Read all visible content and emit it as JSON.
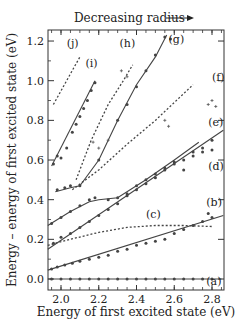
{
  "chart_data": {
    "type": "scatter",
    "title": "Decreasing radius",
    "top_annotation": "Decreasing radius",
    "xlabel": "Energy of first excited state (eV)",
    "ylabel": "Energy – energy of first excited state (eV)",
    "xlim": [
      1.93,
      2.86
    ],
    "ylim": [
      -0.055,
      1.25
    ],
    "xticks": [
      2.0,
      2.2,
      2.4,
      2.6,
      2.8
    ],
    "xtick_labels": [
      "2.0",
      "2.2",
      "2.4",
      "2.6",
      "2.8"
    ],
    "yticks": [
      0.0,
      0.2,
      0.4,
      0.6,
      0.8,
      1.0,
      1.2
    ],
    "ytick_labels": [
      "0.0",
      "0.2",
      "0.4",
      "0.6",
      "0.8",
      "1.0",
      "1.2"
    ],
    "grid": false,
    "legend": "inline curve labels (a)-(j)",
    "series": [
      {
        "name": "(a)",
        "style": "solid",
        "label_pos": [
          2.77,
          -0.03
        ],
        "line": [
          [
            1.93,
            0.0
          ],
          [
            2.85,
            0.0
          ]
        ],
        "points": [
          [
            1.95,
            0.0
          ],
          [
            2.0,
            0.0
          ],
          [
            2.05,
            0.0
          ],
          [
            2.1,
            0.0
          ],
          [
            2.15,
            0.0
          ],
          [
            2.2,
            0.0
          ],
          [
            2.25,
            0.0
          ],
          [
            2.3,
            0.0
          ],
          [
            2.35,
            0.0
          ],
          [
            2.4,
            0.0
          ],
          [
            2.45,
            0.0
          ],
          [
            2.5,
            0.0
          ],
          [
            2.55,
            0.0
          ],
          [
            2.6,
            0.0
          ],
          [
            2.65,
            0.0
          ],
          [
            2.7,
            0.0
          ],
          [
            2.75,
            0.0
          ],
          [
            2.8,
            0.0
          ]
        ]
      },
      {
        "name": "(b)",
        "style": "solid",
        "label_pos": [
          2.77,
          0.37
        ],
        "line": [
          [
            1.93,
            0.045
          ],
          [
            2.86,
            0.32
          ]
        ],
        "points": [
          [
            1.95,
            0.05
          ],
          [
            1.98,
            0.06
          ],
          [
            2.02,
            0.07
          ],
          [
            2.06,
            0.08
          ],
          [
            2.1,
            0.09
          ],
          [
            2.15,
            0.1
          ],
          [
            2.2,
            0.11
          ],
          [
            2.25,
            0.12
          ],
          [
            2.3,
            0.14
          ],
          [
            2.35,
            0.15
          ],
          [
            2.4,
            0.17
          ],
          [
            2.45,
            0.18
          ],
          [
            2.5,
            0.19
          ],
          [
            2.55,
            0.2
          ],
          [
            2.6,
            0.23
          ],
          [
            2.65,
            0.25
          ],
          [
            2.7,
            0.27
          ],
          [
            2.75,
            0.29
          ],
          [
            2.8,
            0.31
          ],
          [
            2.78,
            0.33
          ]
        ]
      },
      {
        "name": "(c)",
        "style": "dashed",
        "label_pos": [
          2.45,
          0.31
        ],
        "line": [
          [
            1.93,
            0.17
          ],
          [
            2.05,
            0.2
          ],
          [
            2.2,
            0.235
          ],
          [
            2.35,
            0.26
          ],
          [
            2.5,
            0.27
          ],
          [
            2.65,
            0.27
          ],
          [
            2.8,
            0.265
          ]
        ],
        "points": []
      },
      {
        "name": "(d)",
        "style": "solid",
        "label_pos": [
          2.78,
          0.55
        ],
        "line": [
          [
            1.93,
            0.15
          ],
          [
            2.86,
            0.75
          ]
        ],
        "points": [
          [
            1.96,
            0.18
          ],
          [
            2.0,
            0.21
          ],
          [
            2.05,
            0.23
          ],
          [
            2.1,
            0.26
          ],
          [
            2.15,
            0.29
          ],
          [
            2.2,
            0.32
          ],
          [
            2.25,
            0.35
          ],
          [
            2.3,
            0.38
          ],
          [
            2.35,
            0.42
          ],
          [
            2.4,
            0.45
          ],
          [
            2.45,
            0.48
          ],
          [
            2.5,
            0.51
          ],
          [
            2.55,
            0.55
          ],
          [
            2.6,
            0.58
          ],
          [
            2.65,
            0.6
          ],
          [
            2.7,
            0.64
          ],
          [
            2.75,
            0.66
          ],
          [
            2.8,
            0.7
          ]
        ]
      },
      {
        "name": "(e)",
        "style": "solid",
        "label_pos": [
          2.78,
          0.77
        ],
        "line": [
          [
            1.93,
            0.27
          ],
          [
            2.05,
            0.34
          ],
          [
            2.15,
            0.39
          ],
          [
            2.2,
            0.4
          ],
          [
            2.3,
            0.41
          ],
          [
            2.45,
            0.5
          ],
          [
            2.6,
            0.6
          ],
          [
            2.73,
            0.69
          ]
        ],
        "points": [
          [
            1.95,
            0.28
          ],
          [
            2.0,
            0.31
          ],
          [
            2.05,
            0.34
          ],
          [
            2.1,
            0.37
          ],
          [
            2.15,
            0.4
          ],
          [
            2.18,
            0.41
          ],
          [
            2.25,
            0.4
          ],
          [
            2.3,
            0.41
          ],
          [
            2.35,
            0.43
          ],
          [
            2.4,
            0.47
          ],
          [
            2.45,
            0.5
          ],
          [
            2.5,
            0.53
          ],
          [
            2.55,
            0.56
          ],
          [
            2.6,
            0.59
          ],
          [
            2.65,
            0.55
          ],
          [
            2.7,
            0.62
          ],
          [
            2.75,
            0.64
          ],
          [
            2.8,
            0.65
          ]
        ]
      },
      {
        "name": "(f)",
        "style": "dashed",
        "label_pos": [
          2.8,
          1.0
        ],
        "line": [
          [
            2.06,
            0.45
          ],
          [
            2.2,
            0.55
          ],
          [
            2.35,
            0.68
          ],
          [
            2.5,
            0.8
          ],
          [
            2.6,
            0.89
          ],
          [
            2.7,
            0.98
          ]
        ],
        "points": [
          [
            2.78,
            0.88
          ],
          [
            2.8,
            0.9
          ],
          [
            2.82,
            0.87
          ],
          [
            2.55,
            0.8
          ],
          [
            2.57,
            0.77
          ]
        ]
      },
      {
        "name": "(g)",
        "style": "solid",
        "label_pos": [
          2.57,
          1.19
        ],
        "line": [
          [
            1.97,
            0.44
          ],
          [
            2.05,
            0.46
          ],
          [
            2.1,
            0.47
          ],
          [
            2.2,
            0.6
          ],
          [
            2.3,
            0.8
          ],
          [
            2.4,
            0.98
          ],
          [
            2.5,
            1.12
          ],
          [
            2.56,
            1.23
          ]
        ],
        "points": [
          [
            1.98,
            0.45
          ],
          [
            2.02,
            0.46
          ],
          [
            2.05,
            0.47
          ],
          [
            2.1,
            0.47
          ],
          [
            2.2,
            0.6
          ],
          [
            2.3,
            0.8
          ],
          [
            2.35,
            0.88
          ],
          [
            2.4,
            0.97
          ],
          [
            2.45,
            1.05
          ],
          [
            2.5,
            1.13
          ],
          [
            2.55,
            1.22
          ],
          [
            2.58,
            1.21
          ]
        ]
      },
      {
        "name": "(h)",
        "style": "dashed",
        "label_pos": [
          2.31,
          1.17
        ],
        "line": [
          [
            2.08,
            0.5
          ],
          [
            2.16,
            0.7
          ],
          [
            2.25,
            0.88
          ],
          [
            2.33,
            1.0
          ],
          [
            2.38,
            1.08
          ]
        ],
        "points": [
          [
            2.17,
            0.69
          ],
          [
            2.2,
            0.66
          ],
          [
            2.25,
            0.7
          ],
          [
            2.32,
            1.05
          ],
          [
            2.35,
            1.02
          ]
        ]
      },
      {
        "name": "(i)",
        "style": "solid",
        "label_pos": [
          2.13,
          1.07
        ],
        "line": [
          [
            1.95,
            0.57
          ],
          [
            2.18,
            1.0
          ]
        ],
        "points": [
          [
            1.96,
            0.58
          ],
          [
            1.98,
            0.62
          ],
          [
            2.0,
            0.61
          ],
          [
            2.03,
            0.66
          ],
          [
            2.06,
            0.74
          ],
          [
            2.08,
            0.78
          ],
          [
            2.1,
            0.82
          ],
          [
            2.12,
            0.86
          ],
          [
            2.14,
            0.9
          ],
          [
            2.16,
            0.95
          ],
          [
            2.18,
            0.99
          ]
        ]
      },
      {
        "name": "(j)",
        "style": "dashed",
        "label_pos": [
          2.03,
          1.17
        ],
        "line": [
          [
            1.96,
            0.88
          ],
          [
            2.1,
            1.12
          ]
        ],
        "points": []
      }
    ]
  }
}
